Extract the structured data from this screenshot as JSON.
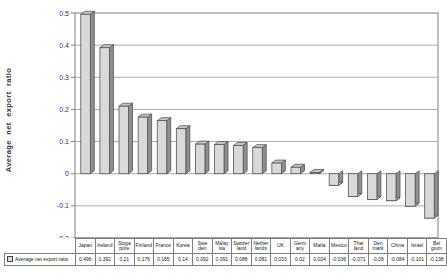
{
  "figure": {
    "background": "#ffffff"
  },
  "chart_data": {
    "type": "bar",
    "style": "3d-column",
    "title": "",
    "xlabel": "",
    "ylabel": "Average net export ratio",
    "series_name": "Average net export ratio",
    "legend_position": "table-row-left",
    "grid": true,
    "ylim": [
      -0.2,
      0.5
    ],
    "ytick_step": 0.1,
    "ytick_labels": [
      "0.5",
      "0.4",
      "0.3",
      "0.2",
      "0.1",
      "0",
      "-0.1",
      "-0.2"
    ],
    "categories": [
      "Japan",
      "Ireland",
      "Singapore",
      "Finland",
      "France",
      "Korea",
      "Sweden",
      "Malaysia",
      "Switzerland",
      "Netherlands",
      "UK",
      "Germany",
      "Malta",
      "Mexico",
      "Thailand",
      "Denmark",
      "China",
      "Israel",
      "Belgium"
    ],
    "category_display": [
      "Japan",
      "Ireland",
      "Singa\npore",
      "Finland",
      "France",
      "Korea",
      "Swe\nden",
      "Malay\nsia",
      "Switzer\nland",
      "Nether\nlands",
      "UK",
      "Germ\nany",
      "Malta",
      "Mexico",
      "Thai\nland",
      "Den\nmark",
      "China",
      "Israel",
      "Bel\ngium"
    ],
    "values": [
      0.496,
      0.392,
      0.21,
      0.176,
      0.165,
      0.14,
      0.092,
      0.091,
      0.088,
      0.081,
      0.033,
      0.02,
      0.004,
      -0.036,
      -0.071,
      -0.08,
      -0.084,
      -0.101,
      -0.138
    ],
    "value_labels": [
      "0.496",
      "0.392",
      "0.21",
      "0.176",
      "0.165",
      "0.14",
      "0.092",
      "0.091",
      "0.088",
      "0.081",
      "0.033",
      "0.02",
      "0.004",
      "-0.036",
      "-0.071",
      "-0.08",
      "-0.084",
      "-0.101",
      "-0.138"
    ],
    "colors": {
      "bar_front": "#d9d9d9",
      "bar_side": "#8f8f8f",
      "bar_top": "#c6c6c6",
      "outline": "#4d4d4d",
      "gridline": "#ababab",
      "wall_border": "#808080",
      "tick_text": "#333333"
    }
  }
}
